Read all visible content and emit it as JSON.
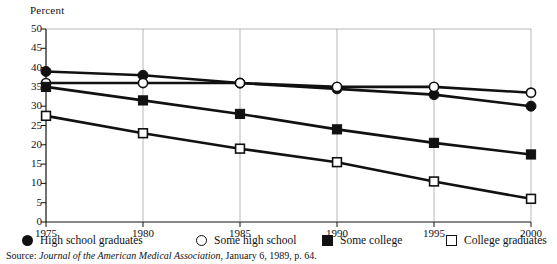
{
  "chart_data": {
    "type": "line",
    "title": "",
    "xlabel": "",
    "ylabel": "Percent",
    "x": [
      1975,
      1980,
      1985,
      1990,
      1995,
      2000
    ],
    "xtick_labels": [
      "1975",
      "1980",
      "1985",
      "1990",
      "1995",
      "2000"
    ],
    "ytick_labels": [
      "0",
      "5",
      "10",
      "15",
      "20",
      "25",
      "30",
      "35",
      "40",
      "45",
      "50"
    ],
    "ylim": [
      0,
      50
    ],
    "xlim": [
      1975,
      2000
    ],
    "ytick_step": 5,
    "grid": false,
    "legend_position": "below-axes",
    "series": [
      {
        "name": "High school graduates",
        "marker": "circle-filled",
        "values": [
          39,
          38,
          36,
          34.5,
          33,
          30
        ]
      },
      {
        "name": "Some high school",
        "marker": "circle-open",
        "values": [
          36,
          36,
          36,
          35,
          35,
          33.5
        ]
      },
      {
        "name": "Some college",
        "marker": "square-filled",
        "values": [
          35,
          31.5,
          28,
          24,
          20.5,
          17.5
        ]
      },
      {
        "name": "College graduates",
        "marker": "square-open",
        "values": [
          27.5,
          23,
          19,
          15.5,
          10.5,
          6
        ]
      }
    ]
  },
  "source": {
    "prefix": "Source: ",
    "italic": "Journal of the American Medical Association",
    "suffix": ", January 6, 1989, p. 64."
  }
}
